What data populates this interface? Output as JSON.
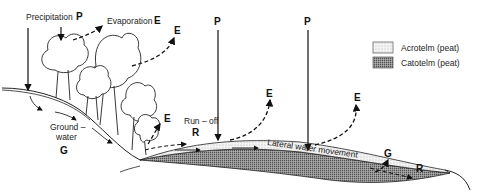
{
  "diagram": {
    "labels": {
      "precipitation": "Precipitation",
      "p": "P",
      "evaporation": "Evaporation",
      "e": "E",
      "groundwater_line1": "Ground –",
      "groundwater_line2": "water",
      "g": "G",
      "runoff": "Run – off",
      "r": "R",
      "lateral": "Lateral water movement"
    },
    "legend": {
      "items": [
        {
          "label": "Acrotelm (peat)",
          "pattern": "light-stipple"
        },
        {
          "label": "Catotelm (peat)",
          "pattern": "dense-stipple"
        }
      ]
    }
  }
}
